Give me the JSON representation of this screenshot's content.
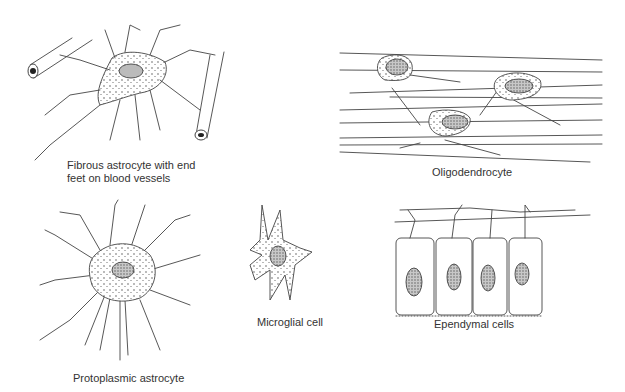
{
  "figure": {
    "panels": [
      {
        "id": "fibrous-astrocyte",
        "label": "Fibrous astrocyte with end\nfeet on blood vessels"
      },
      {
        "id": "oligodendrocyte",
        "label": "Oligodendrocyte"
      },
      {
        "id": "protoplasmic-astrocyte",
        "label": "Protoplasmic astrocyte"
      },
      {
        "id": "microglial-cell",
        "label": "Microglial cell"
      },
      {
        "id": "ependymal-cells",
        "label": "Ependymal cells"
      }
    ]
  }
}
